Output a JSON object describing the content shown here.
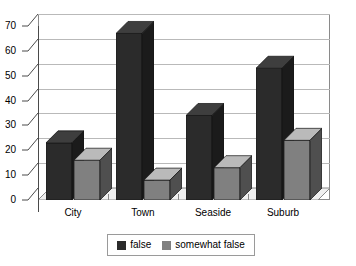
{
  "chart_data": {
    "type": "bar",
    "title": "",
    "subtitle": "",
    "xlabel": "",
    "ylabel": "",
    "categories": [
      "City",
      "Town",
      "Seaside",
      "Suburb"
    ],
    "series": [
      {
        "name": "false",
        "values": [
          23,
          67,
          34,
          53
        ],
        "color": "#2b2b2b"
      },
      {
        "name": "somewhat false",
        "values": [
          16,
          8,
          13,
          24
        ],
        "color": "#808080"
      }
    ],
    "ylim": [
      0,
      70
    ],
    "yticks": [
      0,
      10,
      20,
      30,
      40,
      50,
      60,
      70
    ],
    "ytick_labels": [
      "0",
      "10",
      "20",
      "30",
      "40",
      "50",
      "60",
      "70"
    ],
    "grid": true,
    "grid_axis": "y",
    "legend_position": "bottom",
    "style": "3d-column",
    "annotations": []
  },
  "colors": {
    "series_false": "#2b2b2b",
    "series_false_side": "#1a1a1a",
    "series_false_top": "#3d3d3d",
    "series_somewhat_false": "#808080",
    "series_somewhat_false_side": "#5e5e5e",
    "series_somewhat_false_top": "#9a9a9a",
    "grid": "#b9b9b9",
    "axis": "#4a4a4a",
    "plot_border": "#8a8a8a",
    "background": "#ffffff",
    "text": "#000000"
  },
  "legend": {
    "items": [
      {
        "label": "false",
        "color": "#2b2b2b"
      },
      {
        "label": "somewhat false",
        "color": "#808080"
      }
    ]
  }
}
